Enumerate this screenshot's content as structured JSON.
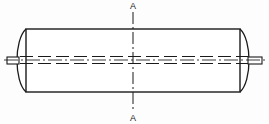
{
  "drawing": {
    "title": "Cylindrical roller shaft assembly - front view with A-A section plane",
    "background_color": "#fdfdfd",
    "line_color": "#1a1a1a",
    "fill_color": "#ffffff",
    "canvas": {
      "width": 269,
      "height": 124
    },
    "section_labels": {
      "top": "A",
      "bottom": "A",
      "font_size": 9
    },
    "geometry": {
      "body": {
        "left": 26,
        "right": 240,
        "top": 29,
        "bottom": 92,
        "stroke_width": 1.3
      },
      "end_cap_left": {
        "apex_x": 15,
        "top_y": 29,
        "bottom_y": 92,
        "description": "convex arc bulging left from body end face"
      },
      "end_cap_right": {
        "apex_x": 251,
        "top_y": 29,
        "bottom_y": 92,
        "description": "convex arc bulging right from body end face"
      },
      "shaft_left": {
        "x_start": 7,
        "x_end": 19,
        "y_top": 57,
        "y_bottom": 64
      },
      "shaft_right": {
        "x_start": 248,
        "x_end": 262,
        "y_top": 57,
        "y_bottom": 64
      },
      "hidden_bore_lines": {
        "y_upper": 56.5,
        "y_lower": 63.5,
        "x_start": 20,
        "x_end": 248,
        "dash_pattern": "13,5",
        "stroke_width": 1.1
      },
      "center_line_horizontal": {
        "y": 60,
        "x_start": 4,
        "x_end": 265,
        "dash_pattern": "14,3,2,3",
        "stroke_width": 0.9
      },
      "section_plane_vertical": {
        "x": 133,
        "y_start": 12,
        "y_end": 112,
        "dash_pattern": "12,3,2,3",
        "stroke_width": 1.0
      }
    },
    "labels": {
      "top_label_x": 133,
      "top_label_y": 9,
      "bottom_label_x": 133,
      "bottom_label_y": 120
    }
  }
}
